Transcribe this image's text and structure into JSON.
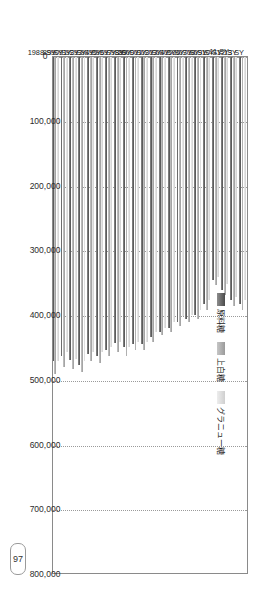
{
  "page": {
    "number": "97"
  },
  "chart_data": {
    "type": "bar",
    "orientation": "horizontal-printed-rotated",
    "title": "",
    "xlabel": "",
    "ylabel": "",
    "grid": true,
    "legend_position": "inside-top-right",
    "ylim": [
      0,
      800000
    ],
    "ticks": [
      "0",
      "100,000",
      "200,000",
      "300,000",
      "400,000",
      "500,000",
      "600,000",
      "700,000",
      "800,000"
    ],
    "tick_values": [
      0,
      100000,
      200000,
      300000,
      400000,
      500000,
      600000,
      700000,
      800000
    ],
    "categories": [
      "1988",
      "89",
      "90",
      "91",
      "92",
      "93",
      "94",
      "95",
      "96",
      "97",
      "98",
      "99",
      "2000",
      "01",
      "02",
      "03",
      "04",
      "05",
      "06",
      "07",
      "08",
      "09",
      "10",
      "11",
      "12",
      "13"
    ],
    "category_suffix": "SY",
    "series": [
      {
        "name": "グラニュー糖",
        "color": "#e0e0e0",
        "values": [
          495000,
          470000,
          462000,
          466000,
          470000,
          455000,
          466000,
          470000,
          455000,
          455000,
          448000,
          440000,
          448000,
          440000,
          440000,
          425000,
          418000,
          410000,
          400000,
          398000,
          390000,
          375000,
          340000,
          350000,
          370000,
          375000
        ]
      },
      {
        "name": "上白糖",
        "color": "#b4b4b4",
        "values": [
          500000,
          492000,
          485000,
          500000,
          490000,
          478000,
          482000,
          486000,
          470000,
          472000,
          462000,
          455000,
          462000,
          452000,
          452000,
          440000,
          430000,
          425000,
          415000,
          410000,
          405000,
          390000,
          352000,
          368000,
          385000,
          390000
        ]
      },
      {
        "name": "原料糖",
        "color": "#6b6b6b",
        "values": [
          492000,
          476000,
          470000,
          508000,
          470000,
          462000,
          468000,
          476000,
          458000,
          462000,
          452000,
          442000,
          448000,
          444000,
          444000,
          432000,
          424000,
          418000,
          410000,
          404000,
          398000,
          382000,
          345000,
          360000,
          376000,
          382000
        ]
      }
    ]
  },
  "legend": {
    "items": [
      {
        "label": "グラニュー糖"
      },
      {
        "label": "上白糖"
      },
      {
        "label": "原料糖"
      }
    ]
  }
}
